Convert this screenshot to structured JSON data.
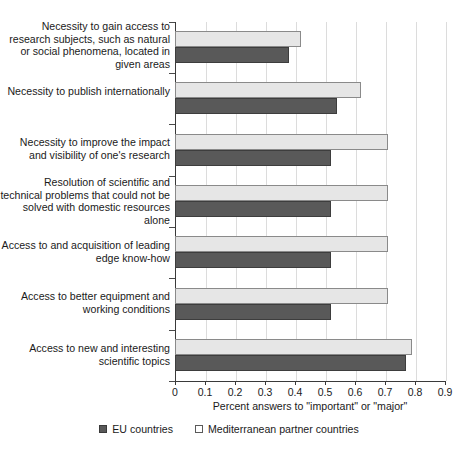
{
  "chart_data": {
    "type": "bar",
    "orientation": "horizontal",
    "title": "",
    "xlabel": "Percent answers to \"important\" or \"major\"",
    "ylabel": "",
    "xlim": [
      0,
      0.9
    ],
    "xticks": [
      "0",
      "0.1",
      "0.2",
      "0.3",
      "0.4",
      "0.5",
      "0.6",
      "0.7",
      "0.8",
      "0.9"
    ],
    "xtick_values": [
      0,
      0.1,
      0.2,
      0.3,
      0.4,
      0.5,
      0.6,
      0.7,
      0.8,
      0.9
    ],
    "grid": true,
    "grid_axis": "x",
    "legend_position": "bottom",
    "categories": [
      "Necessity to gain access to\nresearch subjects, such as\nnatural or social phenomena,\nlocated in given areas",
      "Necessity to publish\ninternationally",
      "Necessity to improve the impact\nand visibility of one's research",
      "Resolution of scientific and\ntechnical problems that could\nnot be solved with domestic\nresources alone",
      "Access to and acquisition of\nleading edge know-how",
      "Access to better equipment\nand working conditions",
      "Access to new and interesting\nscientific topics"
    ],
    "series": [
      {
        "name": "EU countries",
        "color": "#595959",
        "values": [
          0.38,
          0.54,
          0.52,
          0.52,
          0.52,
          0.52,
          0.77
        ]
      },
      {
        "name": "Mediterranean partner countries",
        "color": "#e6e6e6",
        "values": [
          0.42,
          0.62,
          0.71,
          0.71,
          0.71,
          0.71,
          0.79
        ]
      }
    ]
  },
  "legend": {
    "items": [
      {
        "label": "EU countries",
        "marker": "filled-square-icon"
      },
      {
        "label": "Mediterranean partner countries",
        "marker": "empty-square-icon"
      }
    ]
  }
}
